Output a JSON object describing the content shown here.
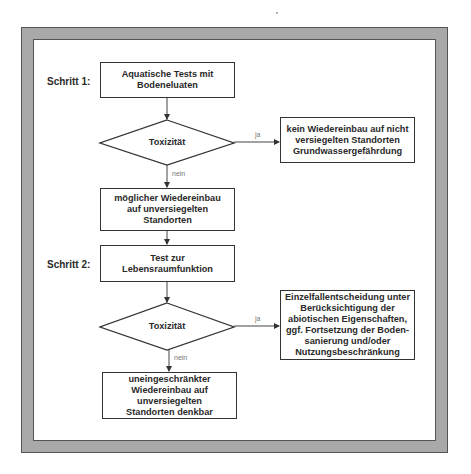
{
  "diagram": {
    "steps": [
      {
        "label": "Schritt 1:"
      },
      {
        "label": "Schritt 2:"
      }
    ],
    "nodes": {
      "aquatic_tests": "Aquatische Tests mit\nBodeneluaten",
      "toxicity_1": "Toxizität",
      "no_reinstallation": "kein Wiedereinbau auf nicht\nversiegelten Standorten\nGrundwassergefährdung",
      "possible_reinstallation": "möglicher Wiedereinbau\nauf unversiegelten\nStandorten",
      "habitat_test": "Test zur\nLebensraumfunktion",
      "toxicity_2": "Toxizität",
      "case_decision": "Einzelfallentscheidung unter\nBerücksichtigung der\nabiotischen Eigenschaften,\nggf. Fortsetzung der Boden-\nsanierung und/oder\nNutzungsbeschränkung",
      "unrestricted_reinstallation": "uneingeschränkter\nWiedereinbau auf\nunversiegelten\nStandorten denkbar"
    },
    "edge_labels": {
      "yes_1": "ja",
      "no_1": "nein",
      "yes_2": "ja",
      "no_2": "nein"
    },
    "colors": {
      "frame_gray": "#a9a9a9",
      "line": "#333333",
      "text": "#2a2a2a"
    }
  }
}
